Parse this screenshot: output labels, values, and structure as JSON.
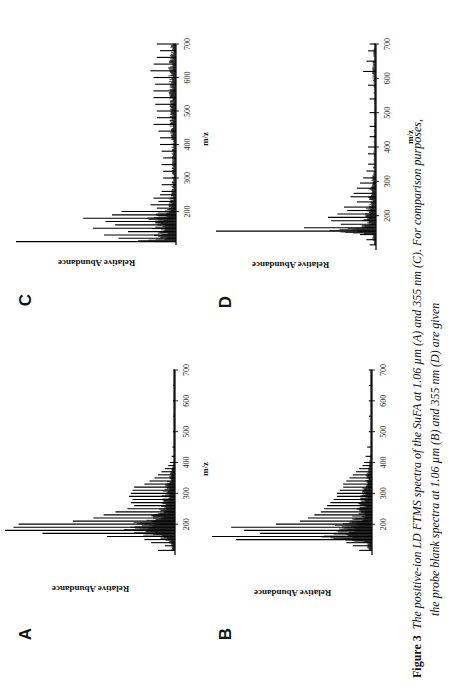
{
  "figure": {
    "label": "Figure 3",
    "caption_line1": "The positive-ion LD FTMS spectra of the SuFA at 1.06 µm (A) and 355 nm (C). For comparison purposes,",
    "caption_line2": "the probe blank spectra at 1.06 µm (B) and 355 nm (D) are given"
  },
  "panels": {
    "A": {
      "letter": "A",
      "ylabel": "Relative Abundance",
      "xlabel": "m/z"
    },
    "B": {
      "letter": "B",
      "ylabel": "Relative Abundance",
      "xlabel": "m/z"
    },
    "C": {
      "letter": "C",
      "ylabel": "Relative Abundance",
      "xlabel": "m/z"
    },
    "D": {
      "letter": "D",
      "ylabel": "Relative Abundance",
      "xlabel": "m/z"
    }
  },
  "ticks": [
    "200",
    "300",
    "400",
    "500",
    "600",
    "700"
  ],
  "chart_data": [
    {
      "panel": "A",
      "type": "bar",
      "title": "Positive-ion LD FTMS spectrum of SuFA at 1.06 µm",
      "xlabel": "m/z",
      "ylabel": "Relative Abundance",
      "xlim": [
        100,
        700
      ],
      "xticks": [
        200,
        300,
        400,
        500,
        600,
        700
      ],
      "x": [
        115,
        130,
        140,
        150,
        160,
        170,
        180,
        190,
        200,
        210,
        220,
        230,
        240,
        250,
        260,
        270,
        280,
        290,
        300,
        310,
        320,
        330,
        340,
        350,
        360,
        370,
        380,
        390,
        400,
        420,
        450,
        500,
        550,
        600,
        650,
        700
      ],
      "values": [
        10,
        6,
        14,
        18,
        40,
        78,
        100,
        95,
        92,
        60,
        48,
        42,
        35,
        28,
        24,
        26,
        25,
        27,
        26,
        25,
        24,
        18,
        15,
        12,
        10,
        8,
        6,
        4,
        3,
        2,
        1.5,
        1,
        1,
        1,
        1,
        1
      ]
    },
    {
      "panel": "B",
      "type": "bar",
      "title": "Probe blank spectrum at 1.06 µm",
      "xlabel": "m/z",
      "ylabel": "Relative Abundance",
      "xlim": [
        100,
        700
      ],
      "xticks": [
        200,
        300,
        400,
        500,
        600,
        700
      ],
      "x": [
        115,
        130,
        140,
        150,
        160,
        170,
        180,
        190,
        200,
        210,
        220,
        230,
        240,
        250,
        260,
        270,
        280,
        290,
        300,
        310,
        320,
        330,
        340,
        350,
        360,
        370,
        380,
        390,
        400,
        420,
        450,
        500,
        550,
        600,
        650,
        700
      ],
      "values": [
        8,
        12,
        16,
        85,
        100,
        70,
        80,
        88,
        60,
        45,
        40,
        36,
        32,
        30,
        28,
        26,
        24,
        22,
        22,
        20,
        18,
        18,
        16,
        14,
        12,
        10,
        8,
        6,
        5,
        4,
        3,
        2,
        2,
        2,
        2,
        2
      ]
    },
    {
      "panel": "C",
      "type": "bar",
      "title": "Positive-ion LD FTMS spectrum of SuFA at 355 nm",
      "xlabel": "m/z",
      "ylabel": "Relative Abundance",
      "xlim": [
        100,
        700
      ],
      "xticks": [
        200,
        300,
        400,
        500,
        600,
        700
      ],
      "x": [
        110,
        120,
        130,
        140,
        150,
        160,
        170,
        180,
        190,
        200,
        210,
        220,
        230,
        240,
        250,
        260,
        280,
        300,
        320,
        340,
        360,
        380,
        400,
        420,
        440,
        460,
        480,
        500,
        520,
        540,
        560,
        580,
        600,
        620,
        640,
        660,
        680,
        700
      ],
      "values": [
        100,
        36,
        45,
        30,
        52,
        38,
        44,
        58,
        40,
        34,
        12,
        16,
        11,
        14,
        10,
        9,
        9,
        8,
        8,
        9,
        8,
        9,
        10,
        10,
        11,
        14,
        12,
        12,
        13,
        14,
        14,
        13,
        14,
        16,
        14,
        12,
        10,
        12
      ]
    },
    {
      "panel": "D",
      "type": "bar",
      "title": "Probe blank spectrum at 355 nm",
      "xlabel": "m/z",
      "ylabel": "Relative Abundance",
      "xlim": [
        100,
        700
      ],
      "xticks": [
        200,
        300,
        400,
        500,
        600,
        700
      ],
      "x": [
        115,
        130,
        145,
        155,
        165,
        175,
        185,
        195,
        205,
        215,
        225,
        240,
        255,
        265,
        280,
        295,
        310,
        330,
        350,
        380,
        400,
        430,
        460,
        500,
        540,
        580,
        620,
        650,
        680,
        700
      ],
      "values": [
        4,
        6,
        10,
        100,
        45,
        22,
        28,
        30,
        24,
        18,
        20,
        12,
        16,
        14,
        12,
        10,
        8,
        6,
        5,
        5,
        5,
        4,
        4,
        4,
        4,
        5,
        8,
        6,
        5,
        4
      ]
    }
  ]
}
